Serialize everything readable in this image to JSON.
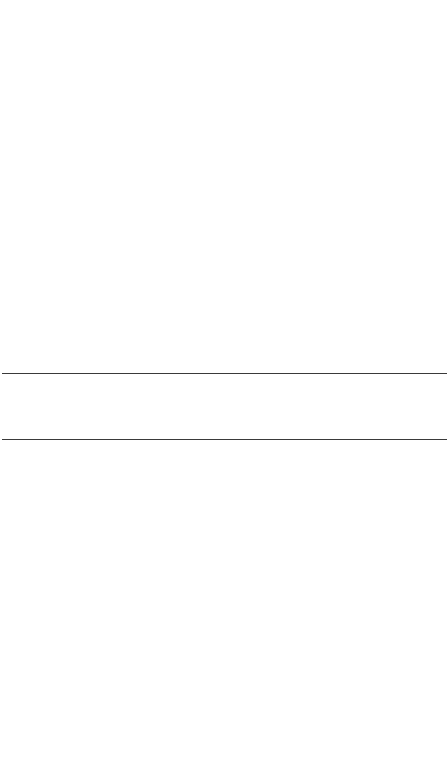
{
  "page": {
    "background_color": "#ffffff",
    "rule_color": "#3a3a3a",
    "rules": [
      {
        "position": "top",
        "y": 373
      },
      {
        "position": "bottom",
        "y": 439
      }
    ],
    "content_text": ""
  }
}
